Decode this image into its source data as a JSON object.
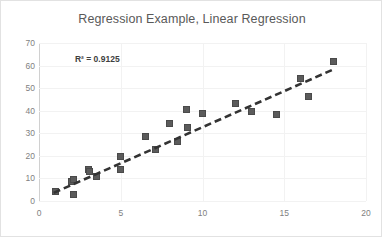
{
  "chart_data": {
    "type": "scatter",
    "title": "Regression Example, Linear Regression",
    "xlabel": "",
    "ylabel": "",
    "xlim": [
      0,
      20
    ],
    "ylim": [
      0,
      70
    ],
    "xticks": [
      0,
      5,
      10,
      15,
      20
    ],
    "yticks": [
      0,
      10,
      20,
      30,
      40,
      50,
      60,
      70
    ],
    "grid": "horizontal-and-vertical-light",
    "legend": "none",
    "annotations": [
      {
        "name": "r-squared",
        "text": "R² = 0.9125",
        "x": 2.2,
        "y": 63
      }
    ],
    "marker_color": "#5b5b5b",
    "marker_shape": "square",
    "trendline": {
      "name": "linear-trendline",
      "style": "dashed",
      "color": "#333333",
      "x_start": 0.9,
      "y_start": 3.6,
      "x_end": 18.1,
      "y_end": 58.6
    },
    "points": [
      {
        "x": 1.0,
        "y": 4.2
      },
      {
        "x": 2.0,
        "y": 8.8
      },
      {
        "x": 2.1,
        "y": 9.4
      },
      {
        "x": 2.1,
        "y": 2.9
      },
      {
        "x": 3.0,
        "y": 14.0
      },
      {
        "x": 3.1,
        "y": 13.0
      },
      {
        "x": 3.5,
        "y": 11.0
      },
      {
        "x": 5.0,
        "y": 19.5
      },
      {
        "x": 5.0,
        "y": 13.8
      },
      {
        "x": 6.5,
        "y": 28.6
      },
      {
        "x": 7.1,
        "y": 22.8
      },
      {
        "x": 8.0,
        "y": 34.4
      },
      {
        "x": 8.5,
        "y": 26.5
      },
      {
        "x": 9.0,
        "y": 40.6
      },
      {
        "x": 9.1,
        "y": 32.4
      },
      {
        "x": 10.0,
        "y": 38.6
      },
      {
        "x": 12.0,
        "y": 43.4
      },
      {
        "x": 13.0,
        "y": 39.5
      },
      {
        "x": 14.5,
        "y": 38.2
      },
      {
        "x": 16.0,
        "y": 54.2
      },
      {
        "x": 16.5,
        "y": 46.1
      },
      {
        "x": 18.0,
        "y": 62.0
      }
    ]
  }
}
